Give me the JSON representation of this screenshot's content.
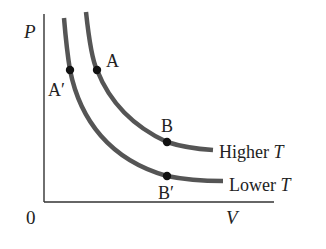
{
  "diagram": {
    "type": "PV isotherms",
    "axes": {
      "y_label": "P",
      "x_label": "V",
      "origin_label": "0"
    },
    "curves": [
      {
        "name": "Higher T",
        "label_text": "Higher ",
        "label_var": "T",
        "points": [
          {
            "label": "A",
            "position": "upper-left"
          },
          {
            "label": "B",
            "position": "lower-right"
          }
        ]
      },
      {
        "name": "Lower T",
        "label_text": "Lower ",
        "label_var": "T",
        "points": [
          {
            "label": "A′",
            "position": "upper-left"
          },
          {
            "label": "B′",
            "position": "lower-right"
          }
        ]
      }
    ],
    "colors": {
      "curve": "#555555",
      "axis": "#333333",
      "point": "#111111",
      "text": "#222222"
    }
  }
}
